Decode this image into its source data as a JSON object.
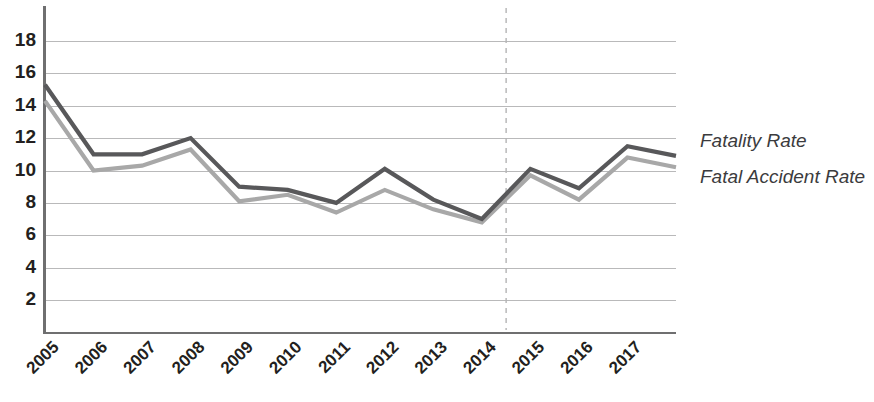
{
  "chart_data": {
    "type": "line",
    "title": "",
    "subtitle": "",
    "xlabel": "",
    "ylabel": "",
    "grid": true,
    "legend_position": "right",
    "ylim": [
      0,
      19
    ],
    "yticks": [
      2,
      4,
      6,
      8,
      10,
      12,
      14,
      16,
      18
    ],
    "ytick_labels": [
      "2",
      "4",
      "6",
      "8",
      "10",
      "12",
      "14",
      "16",
      "18"
    ],
    "categories": [
      "2005",
      "2006",
      "2007",
      "2008",
      "2009",
      "2010",
      "2011",
      "2012",
      "2013",
      "2014",
      "2015",
      "2016",
      "2017",
      ""
    ],
    "series": [
      {
        "name": "Fatality Rate",
        "color": "#58585a",
        "values": [
          15.3,
          11.0,
          11.0,
          12.0,
          9.0,
          8.8,
          8.0,
          10.1,
          8.2,
          7.0,
          10.1,
          8.9,
          11.5,
          10.9
        ]
      },
      {
        "name": "Fatal Accident Rate",
        "color": "#a8a8a8",
        "values": [
          14.3,
          10.0,
          10.3,
          11.3,
          8.1,
          8.5,
          7.4,
          8.8,
          7.6,
          6.8,
          9.7,
          8.2,
          10.8,
          10.2
        ]
      }
    ],
    "annotations": [
      {
        "type": "vertical-dashed-line",
        "name": "forecast-divider",
        "x_between": [
          "2014",
          "2015"
        ],
        "color": "#b4b4b5"
      }
    ]
  },
  "legend": {
    "entries": [
      {
        "label": "Fatality Rate"
      },
      {
        "label": "Fatal Accident Rate"
      }
    ]
  }
}
